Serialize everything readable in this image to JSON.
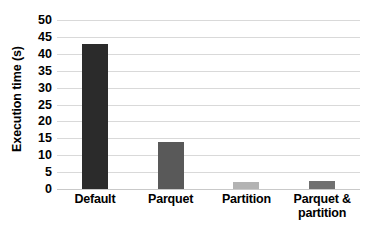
{
  "chart_data": {
    "type": "bar",
    "title": "",
    "xlabel": "",
    "ylabel": "Execution time (s)",
    "categories": [
      "Default",
      "Parquet",
      "Partition",
      "Parquet & partition"
    ],
    "values": [
      43,
      14,
      2,
      2.5
    ],
    "series": [
      {
        "name": "Execution time",
        "values": [
          43,
          14,
          2,
          2.5
        ]
      }
    ],
    "bar_colors": [
      "#2b2b2b",
      "#595959",
      "#b3b3b3",
      "#707070"
    ],
    "ylim": [
      0,
      50
    ],
    "ytick_labels": [
      "50",
      "45",
      "40",
      "35",
      "30",
      "25",
      "20",
      "15",
      "10",
      "5",
      "0"
    ],
    "ytick_values": [
      50,
      45,
      40,
      35,
      30,
      25,
      20,
      15,
      10,
      5,
      0
    ],
    "grid": "horizontal",
    "gridline_color": "#d9d9d9",
    "legend": "none",
    "background": "#ffffff",
    "text_color": "#000000"
  },
  "category_label_lines": [
    [
      "Default"
    ],
    [
      "Parquet"
    ],
    [
      "Partition"
    ],
    [
      "Parquet &",
      "partition"
    ]
  ]
}
